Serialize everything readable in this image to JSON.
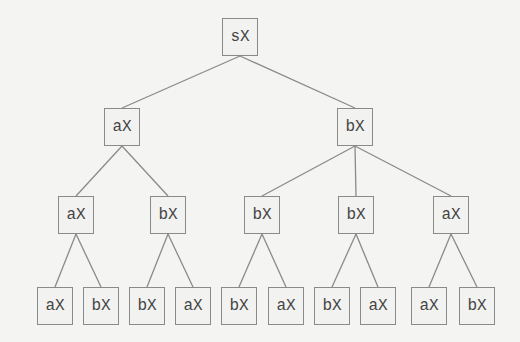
{
  "diagram": {
    "type": "tree",
    "colors": {
      "background": "#f4f4f2",
      "edge": "#8a8a8a",
      "box_border": "#8a8a8a",
      "text": "#444444"
    },
    "nodes": [
      {
        "id": "n0",
        "label": "sX",
        "level": 0,
        "cx": 240,
        "cy": 37
      },
      {
        "id": "n1",
        "label": "aX",
        "level": 1,
        "cx": 122,
        "cy": 127,
        "parent": "n0"
      },
      {
        "id": "n2",
        "label": "bX",
        "level": 1,
        "cx": 355,
        "cy": 127,
        "parent": "n0"
      },
      {
        "id": "n3",
        "label": "aX",
        "level": 2,
        "cx": 76,
        "cy": 215,
        "parent": "n1"
      },
      {
        "id": "n4",
        "label": "bX",
        "level": 2,
        "cx": 168,
        "cy": 215,
        "parent": "n1"
      },
      {
        "id": "n5",
        "label": "bX",
        "level": 2,
        "cx": 262,
        "cy": 215,
        "parent": "n2"
      },
      {
        "id": "n6",
        "label": "bX",
        "level": 2,
        "cx": 356,
        "cy": 215,
        "parent": "n2"
      },
      {
        "id": "n7",
        "label": "aX",
        "level": 2,
        "cx": 451,
        "cy": 215,
        "parent": "n2"
      },
      {
        "id": "n8",
        "label": "aX",
        "level": 3,
        "cx": 55,
        "cy": 306,
        "parent": "n3"
      },
      {
        "id": "n9",
        "label": "bX",
        "level": 3,
        "cx": 101,
        "cy": 306,
        "parent": "n3"
      },
      {
        "id": "n10",
        "label": "bX",
        "level": 3,
        "cx": 147,
        "cy": 306,
        "parent": "n4"
      },
      {
        "id": "n11",
        "label": "aX",
        "level": 3,
        "cx": 193,
        "cy": 306,
        "parent": "n4"
      },
      {
        "id": "n12",
        "label": "bX",
        "level": 3,
        "cx": 239,
        "cy": 306,
        "parent": "n5"
      },
      {
        "id": "n13",
        "label": "aX",
        "level": 3,
        "cx": 286,
        "cy": 306,
        "parent": "n5"
      },
      {
        "id": "n14",
        "label": "bX",
        "level": 3,
        "cx": 332,
        "cy": 306,
        "parent": "n6"
      },
      {
        "id": "n15",
        "label": "aX",
        "level": 3,
        "cx": 378,
        "cy": 306,
        "parent": "n6"
      },
      {
        "id": "n16",
        "label": "aX",
        "level": 3,
        "cx": 429,
        "cy": 306,
        "parent": "n7"
      },
      {
        "id": "n17",
        "label": "bX",
        "level": 3,
        "cx": 477,
        "cy": 306,
        "parent": "n7"
      }
    ]
  }
}
